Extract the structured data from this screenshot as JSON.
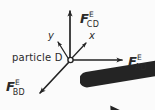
{
  "figure": {
    "type": "free-body-diagram",
    "background_color": "#fbfbfb",
    "stroke_color": "#242424",
    "particle_label": "particle D",
    "origin": {
      "x": 70,
      "y": 60,
      "marker": "small-open-circle"
    }
  },
  "axes": [
    {
      "name": "y",
      "label": "y",
      "direction": "up-left",
      "tip": {
        "x": 56,
        "y": 40
      },
      "label_pos": {
        "x": 48,
        "y": 31
      }
    },
    {
      "name": "x",
      "label": "x",
      "direction": "up-right",
      "tip": {
        "x": 89,
        "y": 40
      },
      "label_pos": {
        "x": 89,
        "y": 31
      }
    }
  ],
  "vectors": [
    {
      "id": "F_CD",
      "symbol": "F",
      "superscript": "E",
      "subscript": "CD",
      "vector_notation": "arrow-overbar",
      "direction": "up",
      "tip": {
        "x": 70,
        "y": 8
      },
      "label_pos": {
        "x": 80,
        "y": 12
      }
    },
    {
      "id": "F_AD",
      "symbol": "F",
      "superscript": "E",
      "subscript": "AD",
      "vector_notation": "arrow-overbar",
      "direction": "right",
      "tip": {
        "x": 126,
        "y": 60
      },
      "label_pos": {
        "x": 128,
        "y": 55
      }
    },
    {
      "id": "F_BD",
      "symbol": "F",
      "superscript": "E",
      "subscript": "BD",
      "vector_notation": "arrow-overbar",
      "direction": "down-left",
      "tip": {
        "x": 36,
        "y": 97
      },
      "label_pos": {
        "x": 6,
        "y": 80
      }
    }
  ]
}
